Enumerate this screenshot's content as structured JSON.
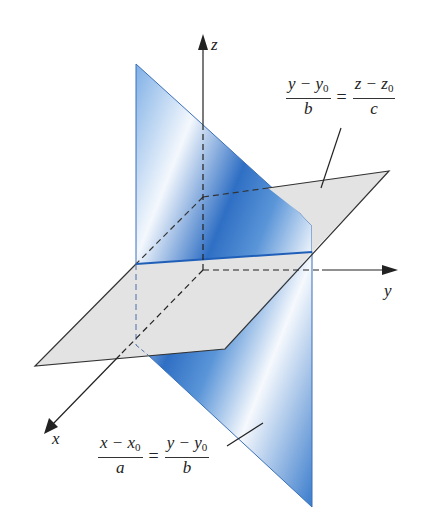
{
  "figure": {
    "type": "3d-line-as-intersection-of-planes",
    "axes": {
      "x_label": "x",
      "y_label": "y",
      "z_label": "z"
    },
    "labels": {
      "top": {
        "left_num_a": "y − y",
        "left_num_sub": "0",
        "left_den": "b",
        "equals": "=",
        "right_num_a": "z − z",
        "right_num_sub": "0",
        "right_den": "c"
      },
      "bottom": {
        "left_num_a": "x − x",
        "left_num_sub": "0",
        "left_den": "a",
        "equals": "=",
        "right_num_a": "y − y",
        "right_num_sub": "0",
        "right_den": "b"
      }
    },
    "colors": {
      "vertical_plane": "#3a78c8",
      "horizontal_plane": "#e4e4e4",
      "intersection_line": "#1f5fb8",
      "axis": "#222222"
    }
  }
}
